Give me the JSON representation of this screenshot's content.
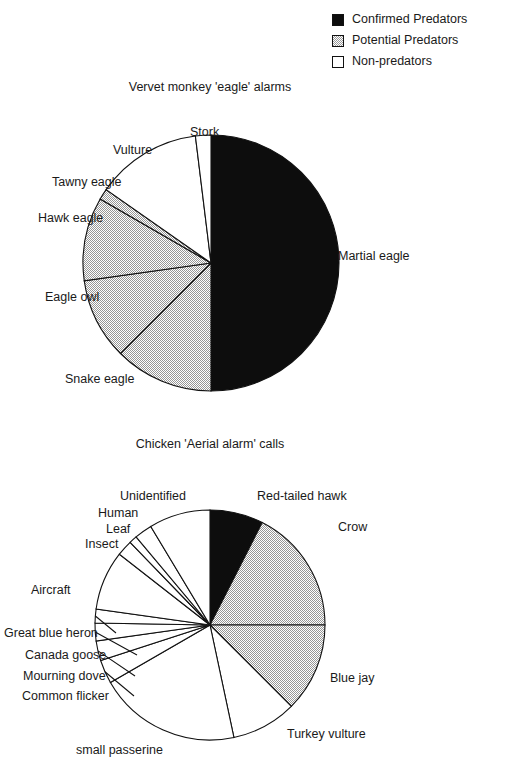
{
  "figure": {
    "legend": {
      "position": "top-right",
      "items": [
        {
          "label": "Confirmed Predators",
          "swatch": "black-filled-square-icon",
          "color": "#0d0d0d"
        },
        {
          "label": "Potential Predators",
          "swatch": "gray-hatched-square-icon",
          "color": "#9a9a9a"
        },
        {
          "label": "Non-predators",
          "swatch": "white-empty-square-icon",
          "color": "#ffffff"
        }
      ]
    }
  },
  "chart_data": [
    {
      "type": "pie",
      "title": "Vervet monkey 'eagle' alarms",
      "xlabel": "",
      "ylabel": "",
      "legend_position": "top-right",
      "grid": false,
      "categories": [
        "Martial eagle",
        "Snake eagle",
        "Eagle owl",
        "Hawk eagle",
        "Tawny eagle",
        "Vulture",
        "Stork"
      ],
      "values": [
        50.0,
        12.5,
        10.3,
        10.6,
        1.4,
        13.3,
        1.9
      ],
      "units": "percent of alarms",
      "slices": [
        {
          "label": "Martial eagle",
          "value": 50.0,
          "category": "Confirmed Predators",
          "fill": "black",
          "start_deg": 0,
          "end_deg": 180,
          "label_x": 338,
          "label_y": 249,
          "align": "left",
          "leader": false
        },
        {
          "label": "Snake eagle",
          "value": 12.5,
          "category": "Potential Predators",
          "fill": "gray",
          "start_deg": 180,
          "end_deg": 225,
          "label_x": 65,
          "label_y": 372,
          "align": "left",
          "leader": false
        },
        {
          "label": "Eagle owl",
          "value": 10.3,
          "category": "Potential Predators",
          "fill": "gray",
          "start_deg": 225,
          "end_deg": 262,
          "label_x": 45,
          "label_y": 290,
          "align": "left",
          "leader": false
        },
        {
          "label": "Hawk eagle",
          "value": 10.6,
          "category": "Potential Predators",
          "fill": "gray",
          "start_deg": 262,
          "end_deg": 300,
          "label_x": 38,
          "label_y": 211,
          "align": "left",
          "leader": false
        },
        {
          "label": "Tawny eagle",
          "value": 1.4,
          "category": "Potential Predators",
          "fill": "gray",
          "start_deg": 300,
          "end_deg": 305,
          "label_x": 52,
          "label_y": 175,
          "align": "left",
          "leader": false
        },
        {
          "label": "Vulture",
          "value": 13.3,
          "category": "Non-predators",
          "fill": "white",
          "start_deg": 305,
          "end_deg": 353,
          "label_x": 113,
          "label_y": 143,
          "align": "left",
          "leader": false
        },
        {
          "label": "Stork",
          "value": 1.9,
          "category": "Non-predators",
          "fill": "white",
          "start_deg": 353,
          "end_deg": 360,
          "label_x": 190,
          "label_y": 125,
          "align": "left",
          "leader": false
        }
      ]
    },
    {
      "type": "pie",
      "title": "Chicken 'Aerial alarm' calls",
      "xlabel": "",
      "ylabel": "",
      "legend_position": "top-right",
      "grid": false,
      "categories": [
        "Red-tailed hawk",
        "Crow",
        "Blue jay",
        "Turkey vulture",
        "small passerine",
        "Common flicker",
        "Mourning dove",
        "Canada goose",
        "Great blue heron",
        "Aircraft",
        "Insect",
        "Leaf",
        "Human",
        "Unidentified"
      ],
      "values": [
        7.5,
        17.5,
        12.5,
        9.2,
        20.0,
        3.3,
        2.8,
        2.5,
        1.9,
        8.3,
        2.2,
        1.1,
        2.5,
        8.7
      ],
      "units": "percent of calls",
      "slices": [
        {
          "label": "Red-tailed hawk",
          "value": 7.5,
          "category": "Confirmed Predators",
          "fill": "black",
          "start_deg": 0,
          "end_deg": 27,
          "label_x": 257,
          "label_y": 489,
          "align": "left",
          "leader": false
        },
        {
          "label": "Crow",
          "value": 17.5,
          "category": "Potential Predators",
          "fill": "gray",
          "start_deg": 27,
          "end_deg": 90,
          "label_x": 338,
          "label_y": 520,
          "align": "left",
          "leader": false
        },
        {
          "label": "Blue jay",
          "value": 12.5,
          "category": "Potential Predators",
          "fill": "gray",
          "start_deg": 90,
          "end_deg": 135,
          "label_x": 330,
          "label_y": 671,
          "align": "left",
          "leader": false
        },
        {
          "label": "Turkey vulture",
          "value": 9.2,
          "category": "Non-predators",
          "fill": "white",
          "start_deg": 135,
          "end_deg": 168,
          "label_x": 287,
          "label_y": 727,
          "align": "left",
          "leader": false
        },
        {
          "label": "small passerine",
          "value": 20.0,
          "category": "Non-predators",
          "fill": "white",
          "start_deg": 168,
          "end_deg": 240,
          "label_x": 76,
          "label_y": 743,
          "align": "left",
          "leader": false
        },
        {
          "label": "Common flicker",
          "value": 3.3,
          "category": "Non-predators",
          "fill": "white",
          "start_deg": 240,
          "end_deg": 252,
          "label_x": 22,
          "label_y": 689,
          "align": "left",
          "leader": true
        },
        {
          "label": "Mourning dove",
          "value": 2.8,
          "category": "Non-predators",
          "fill": "white",
          "start_deg": 252,
          "end_deg": 262,
          "label_x": 23,
          "label_y": 669,
          "align": "left",
          "leader": true
        },
        {
          "label": "Canada goose",
          "value": 2.5,
          "category": "Non-predators",
          "fill": "white",
          "start_deg": 262,
          "end_deg": 271,
          "label_x": 25,
          "label_y": 648,
          "align": "left",
          "leader": true
        },
        {
          "label": "Great blue heron",
          "value": 1.9,
          "category": "Non-predators",
          "fill": "white",
          "start_deg": 271,
          "end_deg": 278,
          "label_x": 4,
          "label_y": 626,
          "align": "left",
          "leader": true
        },
        {
          "label": "Aircraft",
          "value": 8.3,
          "category": "Non-predators",
          "fill": "white",
          "start_deg": 278,
          "end_deg": 308,
          "label_x": 31,
          "label_y": 583,
          "align": "left",
          "leader": false
        },
        {
          "label": "Insect",
          "value": 2.2,
          "category": "Non-predators",
          "fill": "white",
          "start_deg": 308,
          "end_deg": 316,
          "label_x": 85,
          "label_y": 537,
          "align": "left",
          "leader": false
        },
        {
          "label": "Leaf",
          "value": 1.1,
          "category": "Non-predators",
          "fill": "white",
          "start_deg": 316,
          "end_deg": 320,
          "label_x": 106,
          "label_y": 522,
          "align": "left",
          "leader": false
        },
        {
          "label": "Human",
          "value": 2.5,
          "category": "Non-predators",
          "fill": "white",
          "start_deg": 320,
          "end_deg": 329,
          "label_x": 98,
          "label_y": 506,
          "align": "left",
          "leader": false
        },
        {
          "label": "Unidentified",
          "value": 8.7,
          "category": "Non-predators",
          "fill": "white",
          "start_deg": 329,
          "end_deg": 360,
          "label_x": 120,
          "label_y": 489,
          "align": "left",
          "leader": false
        }
      ]
    }
  ]
}
